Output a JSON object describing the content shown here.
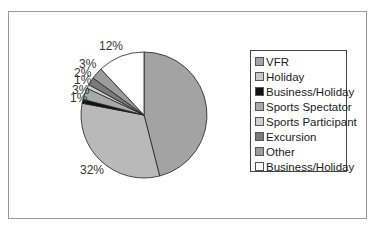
{
  "chart_data": {
    "type": "pie",
    "title": "",
    "start_angle": "12 o'clock, clockwise",
    "categories": [
      "VFR",
      "Holiday",
      "Business/Holiday",
      "Sports Spectator",
      "Sports Participant",
      "Excursion",
      "Other",
      "Business/Holiday"
    ],
    "values": [
      46,
      32,
      1,
      3,
      1,
      2,
      3,
      12
    ],
    "labels": [
      "46%",
      "32%",
      "1%",
      "3%",
      "1%",
      "2%",
      "3%",
      "12%"
    ],
    "colors": [
      "#a3a3a3",
      "#b9b9b9",
      "#111111",
      "#a9a9a9",
      "#cfcfcf",
      "#7a7a7a",
      "#9c9c9c",
      "#ffffff"
    ],
    "legend_position": "right"
  },
  "legend": {
    "items": [
      {
        "label": "VFR",
        "color": "#a3a3a3"
      },
      {
        "label": "Holiday",
        "color": "#c8c8c8"
      },
      {
        "label": "Business/Holiday",
        "color": "#111111"
      },
      {
        "label": "Sports Spectator",
        "color": "#a9a9a9"
      },
      {
        "label": "Sports Participant",
        "color": "#cfcfcf"
      },
      {
        "label": "Excursion",
        "color": "#7a7a7a"
      },
      {
        "label": "Other",
        "color": "#9c9c9c"
      },
      {
        "label": "Business/Holiday",
        "color": "#ffffff"
      }
    ]
  },
  "pie_labels": {
    "vfr": "46%",
    "holiday": "32%",
    "business_holiday_small": "1%",
    "sports_spectator": "3%",
    "sports_participant": "1%",
    "excursion": "2%",
    "other": "3%",
    "business_holiday_large": "12%"
  }
}
